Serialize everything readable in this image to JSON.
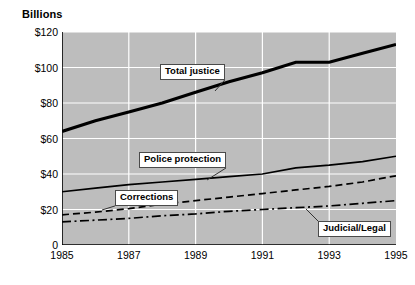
{
  "chart_data": {
    "type": "line",
    "title": "",
    "ylabel": "Billions",
    "xlabel": "",
    "ylim": [
      0,
      120
    ],
    "xlim": [
      1985,
      1995
    ],
    "grid": true,
    "legend_position": "inline-callouts",
    "y_ticks": [
      "0",
      "$20",
      "$40",
      "$60",
      "$80",
      "$100",
      "$120"
    ],
    "y_tick_values": [
      0,
      20,
      40,
      60,
      80,
      100,
      120
    ],
    "x_ticks": [
      "1985",
      "1987",
      "1989",
      "1991",
      "1993",
      "1995"
    ],
    "x_tick_values": [
      1985,
      1987,
      1989,
      1991,
      1993,
      1995
    ],
    "x": [
      1985,
      1986,
      1987,
      1988,
      1989,
      1990,
      1991,
      1992,
      1993,
      1994,
      1995
    ],
    "series": [
      {
        "name": "Total justice",
        "style": "solid",
        "width": "thick",
        "color": "#000000",
        "values": [
          64,
          70,
          75,
          80,
          86,
          92,
          97,
          103,
          103,
          108,
          113
        ]
      },
      {
        "name": "Police protection",
        "style": "solid",
        "width": "thin",
        "color": "#000000",
        "values": [
          30,
          32,
          34,
          35.5,
          37,
          38.5,
          40,
          43.5,
          45,
          47,
          50
        ]
      },
      {
        "name": "Corrections",
        "style": "dashed",
        "width": "thin",
        "color": "#000000",
        "values": [
          17,
          18.5,
          20.5,
          23,
          25,
          27,
          29,
          31,
          33,
          35.5,
          39
        ]
      },
      {
        "name": "Judicial/Legal",
        "style": "dash-dot",
        "width": "thin",
        "color": "#000000",
        "values": [
          13,
          14,
          15,
          16.5,
          17.5,
          19,
          20,
          21,
          22,
          23.5,
          25
        ]
      }
    ],
    "annotations": [
      {
        "label": "Total justice",
        "box_x": 160,
        "box_y": 64,
        "leader_to_x": 215,
        "leader_to_y": 91
      },
      {
        "label": "Police protection",
        "box_x": 139,
        "box_y": 152,
        "leader_to_x": 207,
        "leader_to_y": 180
      },
      {
        "label": "Corrections",
        "box_x": 115,
        "box_y": 190,
        "leader_to_x": 102,
        "leader_to_y": 210
      },
      {
        "label": "Judicial/Legal",
        "box_x": 318,
        "box_y": 221,
        "leader_to_x": 306,
        "leader_to_y": 209
      }
    ],
    "plot_background": "#bdbdbd",
    "gridline_color": "#ffffff",
    "axis_color": "#000000"
  }
}
